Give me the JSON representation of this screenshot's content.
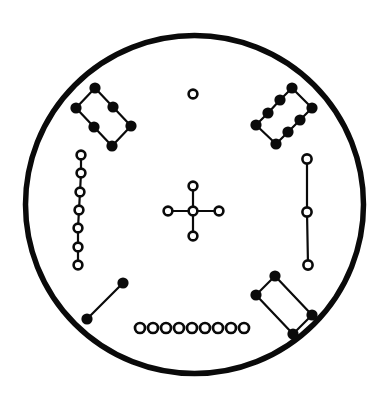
{
  "diagram": {
    "canvas": {
      "width": 385,
      "height": 408,
      "background": "#ffffff",
      "ink": "#0a0a0a"
    },
    "plate": {
      "cx": 194.5,
      "cy": 204.5,
      "r": 169,
      "stroke_width": 5.5
    },
    "defaults": {
      "filled_dot_r": 5.6,
      "open_hole_r": 4.2,
      "ring_width": 2.6,
      "link_width": 2.2
    },
    "groups": [
      {
        "name": "pad-group-top-left",
        "kind": "filled",
        "points": [
          [
            95,
            88
          ],
          [
            113,
            107
          ],
          [
            131,
            126
          ],
          [
            76,
            108
          ],
          [
            94,
            127
          ],
          [
            112,
            146
          ]
        ],
        "edges": [
          [
            0,
            1
          ],
          [
            1,
            2
          ],
          [
            3,
            4
          ],
          [
            4,
            5
          ],
          [
            0,
            3
          ],
          [
            2,
            5
          ]
        ]
      },
      {
        "name": "pad-group-top-right",
        "kind": "filled",
        "points": [
          [
            292,
            88
          ],
          [
            280,
            100
          ],
          [
            268,
            113
          ],
          [
            256,
            125
          ],
          [
            312,
            108
          ],
          [
            300,
            120
          ],
          [
            288,
            132
          ],
          [
            276,
            144
          ]
        ],
        "edges": [
          [
            0,
            1
          ],
          [
            1,
            2
          ],
          [
            2,
            3
          ],
          [
            4,
            5
          ],
          [
            5,
            6
          ],
          [
            6,
            7
          ],
          [
            0,
            4
          ],
          [
            3,
            7
          ]
        ]
      },
      {
        "name": "hole-column-left",
        "kind": "open",
        "points": [
          [
            81,
            155
          ],
          [
            81,
            173
          ],
          [
            80,
            192
          ],
          [
            79,
            210
          ],
          [
            78,
            228
          ],
          [
            78,
            247
          ],
          [
            78,
            265
          ]
        ],
        "edges": [
          [
            0,
            1
          ],
          [
            1,
            2
          ],
          [
            2,
            3
          ],
          [
            3,
            4
          ],
          [
            4,
            5
          ],
          [
            5,
            6
          ]
        ],
        "r": 4.4
      },
      {
        "name": "alignment-hole-top",
        "kind": "open",
        "points": [
          [
            193,
            94
          ]
        ],
        "edges": [],
        "r": 4.4
      },
      {
        "name": "center-cross-holes",
        "kind": "open",
        "points": [
          [
            193,
            186
          ],
          [
            168,
            211
          ],
          [
            193,
            211
          ],
          [
            219,
            211
          ],
          [
            193,
            236
          ]
        ],
        "edges": [
          [
            0,
            4
          ],
          [
            1,
            3
          ]
        ],
        "r": 4.4
      },
      {
        "name": "hole-line-right",
        "kind": "open",
        "points": [
          [
            307,
            159
          ],
          [
            307,
            212
          ],
          [
            308,
            265
          ]
        ],
        "edges": [
          [
            0,
            1
          ],
          [
            1,
            2
          ]
        ],
        "r": 4.6
      },
      {
        "name": "pad-pair-bottom-left",
        "kind": "filled",
        "points": [
          [
            123,
            283
          ],
          [
            87,
            319
          ]
        ],
        "edges": [
          [
            0,
            1
          ]
        ]
      },
      {
        "name": "hole-row-bottom",
        "kind": "open",
        "points": [
          [
            140,
            328
          ],
          [
            153,
            328
          ],
          [
            166,
            328
          ],
          [
            179,
            328
          ],
          [
            192,
            328
          ],
          [
            205,
            328
          ],
          [
            218,
            328
          ],
          [
            231,
            328
          ],
          [
            244,
            328
          ]
        ],
        "edges": [],
        "r": 5.0,
        "ring_width": 2.7
      },
      {
        "name": "pad-group-bottom-right",
        "kind": "filled",
        "points": [
          [
            275,
            276
          ],
          [
            256,
            295
          ],
          [
            312,
            315
          ],
          [
            293,
            334
          ]
        ],
        "edges": [
          [
            0,
            1
          ],
          [
            0,
            2
          ],
          [
            1,
            3
          ],
          [
            2,
            3
          ]
        ]
      }
    ]
  }
}
